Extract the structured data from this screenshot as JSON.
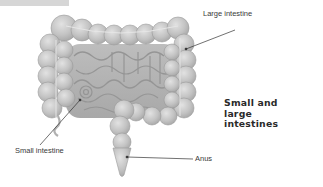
{
  "figure": {
    "title": "Small and large intestines",
    "labels": {
      "large_intestine": "Large intestine",
      "small_intestine": "Small intestine",
      "anus": "Anus"
    },
    "illustration": "grayscale rendering of small and large intestines",
    "colors": {
      "organ_fill": "#c4c4c4",
      "organ_shade": "#a9a9a9",
      "organ_highlight": "#dcdcdc",
      "leader_line": "#333333",
      "text": "#3a3a3a",
      "top_bar": "#d6d6d6"
    }
  }
}
